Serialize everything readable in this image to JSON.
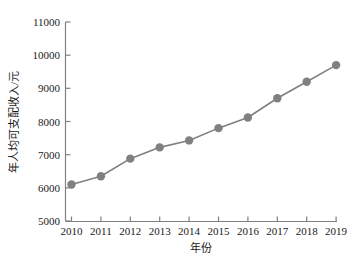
{
  "chart_data": {
    "type": "line",
    "title": "",
    "subtitle": "",
    "xlabel": "年份",
    "ylabel": "年人均可支配收入/元",
    "categories": [
      "2010",
      "2011",
      "2012",
      "2013",
      "2014",
      "2015",
      "2016",
      "2017",
      "2018",
      "2019"
    ],
    "x": [
      2010,
      2011,
      2012,
      2013,
      2014,
      2015,
      2016,
      2017,
      2018,
      2019
    ],
    "values": [
      6100,
      6350,
      6880,
      7220,
      7430,
      7800,
      8120,
      8700,
      9200,
      9700
    ],
    "series": [
      {
        "name": "年人均可支配收入",
        "values": [
          6100,
          6350,
          6880,
          7220,
          7430,
          7800,
          8120,
          8700,
          9200,
          9700
        ]
      }
    ],
    "ylim": [
      5000,
      11000
    ],
    "yticks": [
      5000,
      6000,
      7000,
      8000,
      9000,
      10000,
      11000
    ],
    "ytick_labels": [
      "5000",
      "6000",
      "7000",
      "8000",
      "9000",
      "10000",
      "11000"
    ],
    "xtick_labels": [
      "2010",
      "2011",
      "2012",
      "2013",
      "2014",
      "2015",
      "2016",
      "2017",
      "2018",
      "2019"
    ],
    "grid": false,
    "legend": false,
    "legend_position": "none",
    "marker": "circle",
    "line_color": "#808080",
    "marker_color": "#808080",
    "axis_color": "#808080",
    "text_color": "#1a1a1a",
    "background_color": "#ffffff"
  },
  "axes": {
    "y_tick_0": "5000",
    "y_tick_1": "6000",
    "y_tick_2": "7000",
    "y_tick_3": "8000",
    "y_tick_4": "9000",
    "y_tick_5": "10000",
    "y_tick_6": "11000",
    "x_tick_0": "2010",
    "x_tick_1": "2011",
    "x_tick_2": "2012",
    "x_tick_3": "2013",
    "x_tick_4": "2014",
    "x_tick_5": "2015",
    "x_tick_6": "2016",
    "x_tick_7": "2017",
    "x_tick_8": "2018",
    "x_tick_9": "2019",
    "x_title": "年份",
    "y_title": "年人均可支配收入/元"
  }
}
